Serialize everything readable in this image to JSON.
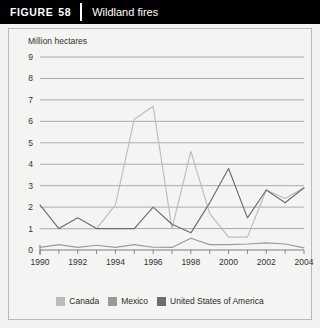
{
  "header": {
    "figure_word": "FIGURE",
    "figure_number": "58",
    "title": "Wildland fires"
  },
  "chart_data": {
    "type": "line",
    "title": "Wildland fires",
    "xlabel": "",
    "ylabel": "Million hectares",
    "ylim": [
      0,
      9
    ],
    "xlim": [
      1990,
      2004
    ],
    "grid": true,
    "legend_position": "bottom",
    "x": [
      1990,
      1991,
      1992,
      1993,
      1994,
      1995,
      1996,
      1997,
      1998,
      1999,
      2000,
      2001,
      2002,
      2003,
      2004
    ],
    "xtick_labels": [
      "1990",
      "1992",
      "1994",
      "1996",
      "1998",
      "2000",
      "2002",
      "2004"
    ],
    "xticks": [
      1990,
      1992,
      1994,
      1996,
      1998,
      2000,
      2002,
      2004
    ],
    "ytick_labels": [
      "0",
      "1",
      "2",
      "3",
      "4",
      "5",
      "6",
      "7",
      "8",
      "9"
    ],
    "yticks": [
      0,
      1,
      2,
      3,
      4,
      5,
      6,
      7,
      8,
      9
    ],
    "series": [
      {
        "name": "Canada",
        "color": "#bcbcba",
        "values": [
          1.0,
          1.0,
          1.0,
          1.0,
          2.1,
          6.1,
          6.7,
          1.0,
          4.6,
          1.7,
          0.6,
          0.6,
          2.8,
          2.4,
          2.9
        ]
      },
      {
        "name": "Mexico",
        "color": "#9a9a97",
        "values": [
          0.12,
          0.25,
          0.12,
          0.22,
          0.12,
          0.25,
          0.13,
          0.12,
          0.55,
          0.25,
          0.25,
          0.28,
          0.33,
          0.28,
          0.1
        ]
      },
      {
        "name": "United States of America",
        "color": "#6d6d6a",
        "values": [
          2.1,
          1.0,
          1.5,
          1.0,
          1.0,
          1.0,
          2.0,
          1.2,
          0.8,
          2.2,
          3.8,
          1.5,
          2.8,
          2.2,
          2.9
        ]
      }
    ]
  },
  "legend": {
    "items": [
      {
        "label": "Canada",
        "color": "#bcbcba"
      },
      {
        "label": "Mexico",
        "color": "#9a9a97"
      },
      {
        "label": "United States of America",
        "color": "#6d6d6a"
      }
    ]
  }
}
